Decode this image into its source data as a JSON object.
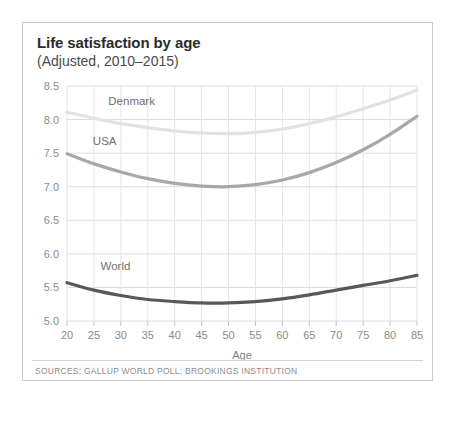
{
  "card": {
    "title": "Life satisfaction by age",
    "subtitle": "(Adjusted, 2010–2015)",
    "source": "SOURCES: GALLUP WORLD POLL; BROOKINGS INSTITUTION"
  },
  "chart_data": {
    "type": "line",
    "title": "Life satisfaction by age",
    "subtitle": "(Adjusted, 2010–2015)",
    "xlabel": "Age",
    "ylabel": "",
    "xlim": [
      20,
      85
    ],
    "ylim": [
      5.0,
      8.5
    ],
    "xticks": [
      20,
      25,
      30,
      35,
      40,
      45,
      50,
      55,
      60,
      65,
      70,
      75,
      80,
      85
    ],
    "yticks": [
      "5.0",
      "5.5",
      "6.0",
      "6.5",
      "7.0",
      "7.5",
      "8.0",
      "8.5"
    ],
    "grid": true,
    "legend_position": "inline-labels",
    "x": [
      20,
      25,
      30,
      35,
      40,
      45,
      50,
      55,
      60,
      65,
      70,
      75,
      80,
      85
    ],
    "series": [
      {
        "name": "Denmark",
        "color": "#e2e2e2",
        "label_x": 32,
        "label_y": 8.22,
        "values": [
          8.11,
          8.02,
          7.94,
          7.88,
          7.83,
          7.8,
          7.79,
          7.81,
          7.86,
          7.94,
          8.04,
          8.16,
          8.29,
          8.44
        ]
      },
      {
        "name": "USA",
        "color": "#a8a8a8",
        "label_x": 27,
        "label_y": 7.62,
        "values": [
          7.49,
          7.34,
          7.22,
          7.12,
          7.05,
          7.01,
          7.0,
          7.03,
          7.1,
          7.21,
          7.36,
          7.55,
          7.78,
          8.05
        ]
      },
      {
        "name": "World",
        "color": "#585858",
        "label_x": 29,
        "label_y": 5.76,
        "values": [
          5.57,
          5.46,
          5.38,
          5.32,
          5.29,
          5.27,
          5.27,
          5.29,
          5.33,
          5.39,
          5.46,
          5.53,
          5.6,
          5.68
        ]
      }
    ]
  }
}
